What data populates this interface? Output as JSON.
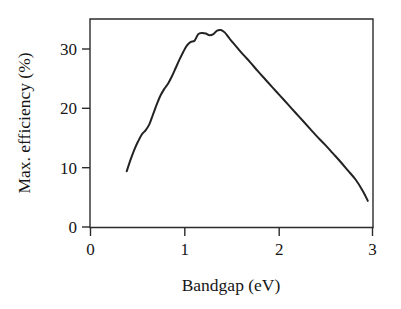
{
  "chart_data": {
    "type": "line",
    "title": "",
    "subtitle": "",
    "xlabel": "Bandgap (eV)",
    "ylabel": "Max. efficiency (%)",
    "xlim": [
      0,
      3
    ],
    "ylim": [
      0,
      35
    ],
    "xticks": [
      0,
      1,
      2,
      3
    ],
    "xtick_labels": [
      "0",
      "1",
      "2",
      "3"
    ],
    "yticks": [
      0,
      10,
      20,
      30
    ],
    "ytick_labels": [
      "0",
      "10",
      "20",
      "30"
    ],
    "grid": false,
    "legend": null,
    "legend_position": "none",
    "annotations": [],
    "series": [
      {
        "name": "Shockley-Queisser limit",
        "color": "#232323",
        "x": [
          0.39,
          0.43,
          0.47,
          0.51,
          0.55,
          0.59,
          0.63,
          0.67,
          0.71,
          0.75,
          0.79,
          0.83,
          0.87,
          0.91,
          0.95,
          0.99,
          1.03,
          1.07,
          1.11,
          1.15,
          1.19,
          1.23,
          1.27,
          1.31,
          1.35,
          1.39,
          1.43,
          1.47,
          1.51,
          1.57,
          1.63,
          1.7,
          1.78,
          1.86,
          1.94,
          2.02,
          2.1,
          2.18,
          2.26,
          2.34,
          2.42,
          2.5,
          2.58,
          2.66,
          2.74,
          2.82,
          2.9,
          2.95
        ],
        "y": [
          9.4,
          11.3,
          13.0,
          14.4,
          15.6,
          16.3,
          17.3,
          19.0,
          20.7,
          22.2,
          23.3,
          24.2,
          25.4,
          26.8,
          28.2,
          29.5,
          30.6,
          31.2,
          31.4,
          32.5,
          32.7,
          32.6,
          32.3,
          32.5,
          33.1,
          33.2,
          32.8,
          32.0,
          31.2,
          30.1,
          29.0,
          27.8,
          26.3,
          24.9,
          23.5,
          22.1,
          20.7,
          19.3,
          17.9,
          16.5,
          15.1,
          13.8,
          12.4,
          11.0,
          9.5,
          8.0,
          6.0,
          4.4
        ]
      }
    ],
    "peak": {
      "x": 1.39,
      "y": 33.2
    },
    "start_point": {
      "x": 0.39,
      "y": 9.4
    },
    "end_point": {
      "x": 2.95,
      "y": 4.4
    }
  },
  "axes": {
    "x_title": "Bandgap (eV)",
    "y_title": "Max. efficiency (%)",
    "x_tick_labels": [
      "0",
      "1",
      "2",
      "3"
    ],
    "y_tick_labels": [
      "0",
      "10",
      "20",
      "30"
    ]
  },
  "style": {
    "curve_color": "#232323",
    "axis_color": "#2b2b2b",
    "background": "#ffffff",
    "text_color": "#161616"
  }
}
